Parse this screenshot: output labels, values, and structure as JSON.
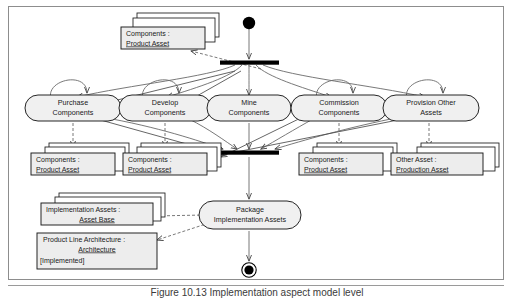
{
  "figure": {
    "caption_number": "Figure 10.13",
    "caption_text": "Figure 10.13  Implementation aspect model level"
  },
  "diagram": {
    "type": "uml-activity-diagram",
    "colors": {
      "frame_border": "#8d8d8d",
      "node_fill": "#f0f0f0",
      "node_stroke": "#1a1a1a",
      "artifact_fill": "#ededed",
      "artifact_stroke": "#1a1a1a",
      "edge": "#4a4a4a",
      "bar_fill": "#000000",
      "initial_node": "#000000",
      "final_node": "#000000"
    },
    "control_nodes": {
      "initial": "initial-node",
      "fork": "fork-bar",
      "join": "join-bar",
      "final": "activity-final-node"
    },
    "activities": [
      {
        "id": "purchase-components",
        "line1": "Purchase",
        "line2": "Components"
      },
      {
        "id": "develop-components",
        "line1": "Develop",
        "line2": "Components"
      },
      {
        "id": "mine-components",
        "line1": "Mine",
        "line2": "Components"
      },
      {
        "id": "commission-components",
        "line1": "Commission",
        "line2": "Components"
      },
      {
        "id": "provision-other-assets",
        "line1": "Provision Other",
        "line2": "Assets"
      },
      {
        "id": "package-implementation-assets",
        "line1": "Package",
        "line2": "Implementation Assets"
      }
    ],
    "artifacts": [
      {
        "id": "artifact-top-components",
        "name": "Components :",
        "type": "Product Asset",
        "stacked": true,
        "state": ""
      },
      {
        "id": "artifact-purchase-output",
        "name": "Components :",
        "type": "Product Asset",
        "stacked": true,
        "state": ""
      },
      {
        "id": "artifact-develop-output",
        "name": "Components :",
        "type": "Product Asset",
        "stacked": true,
        "state": ""
      },
      {
        "id": "artifact-commission-output",
        "name": "Components :",
        "type": "Product Asset",
        "stacked": true,
        "state": ""
      },
      {
        "id": "artifact-provision-output",
        "name": "Other Asset :",
        "type": "Production Asset",
        "stacked": true,
        "state": ""
      },
      {
        "id": "artifact-implementation-assets",
        "name": "Implementation Assets :",
        "type": "Asset Base",
        "stacked": true,
        "state": ""
      },
      {
        "id": "artifact-product-line-architecture",
        "name": "Product Line Architecture :",
        "type": "Architecture",
        "stacked": false,
        "state": "[Implemented]"
      }
    ]
  }
}
